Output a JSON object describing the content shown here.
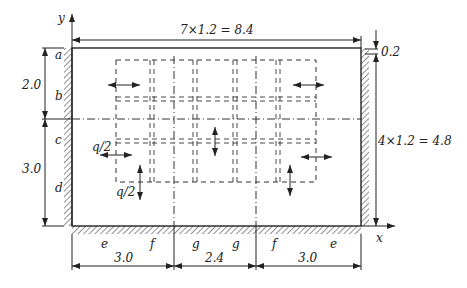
{
  "diagram": {
    "axes": {
      "x_label": "x",
      "y_label": "y"
    },
    "dimensions": {
      "top": "7×1.2 = 8.4",
      "right": "4×1.2 = 4.8",
      "right_small": "0.2",
      "left_upper": "2.0",
      "left_lower": "3.0",
      "bottom": [
        "3.0",
        "2.4",
        "3.0"
      ]
    },
    "left_wall_labels": [
      "a",
      "b",
      "c",
      "d"
    ],
    "bottom_wall_labels": [
      "e",
      "f",
      "g",
      "g",
      "f",
      "e"
    ],
    "loads": {
      "horizontal": "q/2",
      "vertical": "q/2"
    }
  }
}
